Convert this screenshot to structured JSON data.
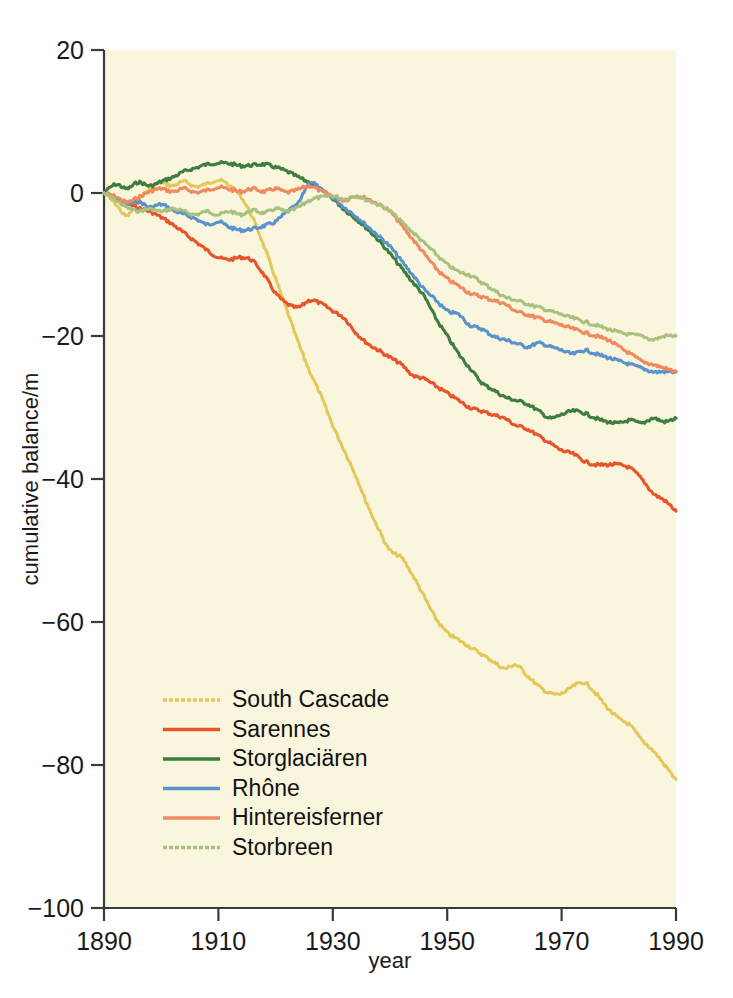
{
  "figure": {
    "background": "#ffffff",
    "plot_background": "#faf6de"
  },
  "axes": {
    "xlabel": "year",
    "ylabel": "cumulative balance/m",
    "x_ticks": [
      "1890",
      "1910",
      "1930",
      "1950",
      "1970",
      "1990"
    ],
    "y_ticks": [
      "20",
      "0",
      "−20",
      "−40",
      "−60",
      "−80",
      "−100"
    ]
  },
  "legend": {
    "items": [
      {
        "label": "South Cascade",
        "color": "#e2c75a",
        "dashed": true
      },
      {
        "label": "Sarennes",
        "color": "#e8532b",
        "dashed": false
      },
      {
        "label": "Storglaciären",
        "color": "#3e7d3e",
        "dashed": false
      },
      {
        "label": "Rhône",
        "color": "#5a93cc",
        "dashed": false
      },
      {
        "label": "Hintereisferner",
        "color": "#f08a5e",
        "dashed": false
      },
      {
        "label": "Storbreen",
        "color": "#a8c27e",
        "dashed": true
      }
    ]
  },
  "chart_data": {
    "type": "line",
    "title": "",
    "xlabel": "year",
    "ylabel": "cumulative balance/m",
    "xlim": [
      1890,
      1990
    ],
    "ylim": [
      -100,
      20
    ],
    "grid": false,
    "legend_position": "lower-left-inside",
    "x": [
      1890,
      1892,
      1894,
      1896,
      1898,
      1900,
      1902,
      1904,
      1906,
      1908,
      1910,
      1912,
      1914,
      1916,
      1918,
      1920,
      1922,
      1924,
      1926,
      1928,
      1930,
      1932,
      1934,
      1936,
      1938,
      1940,
      1942,
      1944,
      1946,
      1948,
      1950,
      1952,
      1954,
      1956,
      1958,
      1960,
      1962,
      1964,
      1966,
      1968,
      1970,
      1972,
      1974,
      1976,
      1978,
      1980,
      1982,
      1984,
      1986,
      1988,
      1990
    ],
    "series": [
      {
        "name": "South Cascade",
        "color": "#e2c75a",
        "values": [
          0,
          -1.5,
          -3.2,
          -1.0,
          0.6,
          1.4,
          1.0,
          1.6,
          0.9,
          1.3,
          1.8,
          1.0,
          -0.6,
          -3.5,
          -7.5,
          -12.0,
          -16.5,
          -21.0,
          -25.0,
          -28.5,
          -32.5,
          -36.0,
          -39.5,
          -43.5,
          -47.0,
          -50.0,
          -51.0,
          -53.5,
          -56.5,
          -59.5,
          -61.5,
          -62.5,
          -63.5,
          -64.5,
          -65.5,
          -66.5,
          -66.0,
          -67.5,
          -69.0,
          -70.0,
          -70.0,
          -69.0,
          -68.5,
          -70.0,
          -72.0,
          -73.5,
          -74.5,
          -76.5,
          -78.0,
          -80.0,
          -82.0
        ]
      },
      {
        "name": "Sarennes",
        "color": "#e8532b",
        "values": [
          0,
          -0.6,
          -1.4,
          -2.1,
          -2.6,
          -3.4,
          -4.4,
          -5.6,
          -6.8,
          -8.0,
          -9.0,
          -9.3,
          -9.0,
          -9.5,
          -11.5,
          -14.0,
          -15.5,
          -16.0,
          -15.0,
          -15.5,
          -16.5,
          -17.5,
          -19.5,
          -21.0,
          -22.0,
          -23.0,
          -24.0,
          -25.5,
          -26.0,
          -27.0,
          -28.0,
          -29.0,
          -30.0,
          -30.5,
          -31.0,
          -31.5,
          -32.5,
          -33.0,
          -34.0,
          -35.0,
          -36.0,
          -36.5,
          -37.5,
          -38.0,
          -38.0,
          -38.0,
          -38.5,
          -40.0,
          -42.0,
          -43.0,
          -44.5
        ]
      },
      {
        "name": "Storglaciären",
        "color": "#3e7d3e",
        "values": [
          0,
          1.2,
          0.6,
          1.5,
          1.0,
          1.6,
          2.2,
          3.0,
          3.5,
          4.0,
          4.2,
          4.1,
          3.8,
          3.9,
          4.0,
          3.6,
          3.0,
          2.2,
          1.4,
          0.4,
          -0.8,
          -2.3,
          -3.6,
          -5.0,
          -6.6,
          -8.5,
          -10.5,
          -12.5,
          -14.5,
          -17.5,
          -20.0,
          -22.5,
          -24.5,
          -26.5,
          -27.5,
          -28.5,
          -29.0,
          -29.5,
          -30.5,
          -31.5,
          -31.0,
          -30.5,
          -30.8,
          -31.5,
          -32.0,
          -32.2,
          -31.8,
          -32.2,
          -31.5,
          -32.0,
          -31.5
        ]
      },
      {
        "name": "Rhône",
        "color": "#5a93cc",
        "values": [
          0,
          -0.8,
          -1.6,
          -1.2,
          -2.0,
          -1.6,
          -2.4,
          -3.0,
          -3.6,
          -4.4,
          -4.0,
          -4.8,
          -5.2,
          -5.0,
          -4.6,
          -4.0,
          -2.6,
          -1.4,
          1.5,
          0.4,
          -0.6,
          -2.0,
          -3.2,
          -4.6,
          -6.0,
          -7.5,
          -9.5,
          -11.5,
          -13.5,
          -15.0,
          -16.5,
          -17.0,
          -18.5,
          -19.0,
          -20.0,
          -20.5,
          -21.0,
          -21.5,
          -21.0,
          -21.5,
          -22.0,
          -22.5,
          -22.0,
          -22.5,
          -23.0,
          -23.5,
          -24.0,
          -24.5,
          -25.0,
          -25.0,
          -25.0
        ]
      },
      {
        "name": "Hintereisferner",
        "color": "#f08a5e",
        "values": [
          0,
          -0.5,
          -1.3,
          -0.6,
          0.2,
          0.6,
          0.2,
          0.6,
          0.1,
          0.4,
          0.8,
          0.5,
          0.2,
          0.6,
          0.2,
          0.6,
          0.1,
          0.5,
          1.0,
          0.2,
          -0.4,
          -1.0,
          -0.4,
          -0.8,
          -1.6,
          -2.6,
          -4.5,
          -6.5,
          -8.5,
          -10.5,
          -12.0,
          -13.0,
          -14.0,
          -14.5,
          -15.0,
          -15.5,
          -16.5,
          -17.0,
          -17.5,
          -18.0,
          -18.5,
          -19.0,
          -19.5,
          -20.0,
          -20.5,
          -21.5,
          -22.5,
          -23.5,
          -24.0,
          -24.5,
          -25.0
        ]
      },
      {
        "name": "Storbreen",
        "color": "#a8c27e",
        "values": [
          0,
          -1.0,
          -2.0,
          -2.5,
          -2.2,
          -2.6,
          -2.2,
          -2.6,
          -3.0,
          -2.6,
          -3.0,
          -2.6,
          -3.0,
          -2.4,
          -2.8,
          -2.2,
          -2.6,
          -2.0,
          -1.0,
          -0.6,
          -0.4,
          -0.8,
          -0.4,
          -1.0,
          -1.6,
          -2.5,
          -4.0,
          -5.5,
          -7.0,
          -8.5,
          -10.0,
          -11.0,
          -11.5,
          -12.5,
          -13.5,
          -14.5,
          -15.0,
          -15.5,
          -16.0,
          -16.5,
          -17.0,
          -17.5,
          -18.0,
          -18.5,
          -19.0,
          -19.5,
          -19.8,
          -20.0,
          -20.5,
          -20.0,
          -20.0
        ]
      }
    ]
  }
}
